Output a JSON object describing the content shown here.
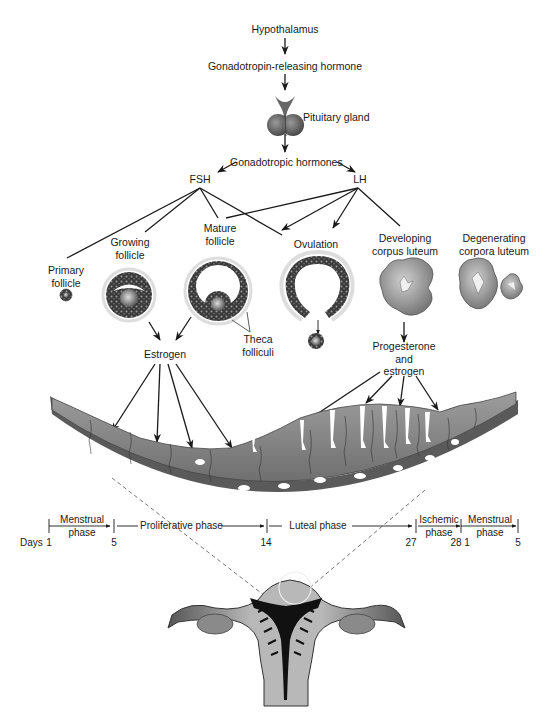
{
  "cascade": {
    "hypothalamus": "Hypothalamus",
    "gnrh": "Gonadotropin-releasing hormone",
    "pituitary": "Pituitary gland",
    "gonadotropic": "Gonadotropic hormones",
    "fsh": "FSH",
    "lh": "LH"
  },
  "ovarian_stages": [
    {
      "id": "primary",
      "line1": "Primary",
      "line2": "follicle"
    },
    {
      "id": "growing",
      "line1": "Growing",
      "line2": "follicle"
    },
    {
      "id": "mature",
      "line1": "Mature",
      "line2": "follicle"
    },
    {
      "id": "ovulation",
      "line1": "Ovulation",
      "line2": ""
    },
    {
      "id": "developing",
      "line1": "Developing",
      "line2": "corpus luteum"
    },
    {
      "id": "degenerating",
      "line1": "Degenerating",
      "line2": "corpora luteum"
    }
  ],
  "annotations": {
    "theca_line1": "Theca",
    "theca_line2": "folliculi",
    "estrogen": "Estrogen",
    "prog_line1": "Progesterone",
    "prog_line2": "and",
    "prog_line3": "estrogen"
  },
  "timeline": {
    "days_label": "Days",
    "phases": [
      {
        "line1": "Menstrual",
        "line2": "phase",
        "start_day": "1",
        "end_day": "5"
      },
      {
        "line1": "Proliferative phase",
        "line2": "",
        "start_day": "5",
        "end_day": "14"
      },
      {
        "line1": "Luteal phase",
        "line2": "",
        "start_day": "14",
        "end_day": "27"
      },
      {
        "line1": "Ischemic",
        "line2": "phase",
        "start_day": "27",
        "end_day": "28"
      },
      {
        "line1": "Menstrual",
        "line2": "phase",
        "start_day": "1",
        "end_day": "5"
      }
    ],
    "ticks": [
      "1",
      "5",
      "14",
      "27",
      "28",
      "1",
      "5"
    ]
  },
  "colors": {
    "line": "#1a1a1a",
    "tissue": "#8a8a8a",
    "tissue_light": "#b5b5b5",
    "dark": "#2a2a2a"
  }
}
